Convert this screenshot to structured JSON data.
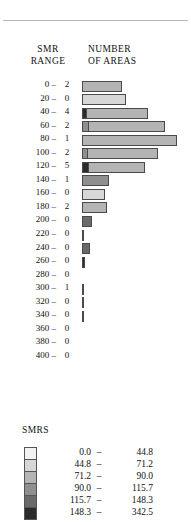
{
  "headers": {
    "smr_range": "SMR\nRANGE",
    "number_of_areas": "NUMBER\nOF AREAS"
  },
  "legend": {
    "title": "SMRS",
    "dash": "–",
    "classes": [
      {
        "lo": "0.0",
        "hi": "44.8",
        "swatch": "#f2f2f2"
      },
      {
        "lo": "44.8",
        "hi": "71.2",
        "swatch": "#d7d7d7"
      },
      {
        "lo": "71.2",
        "hi": "90.0",
        "swatch": "#b4b4b4"
      },
      {
        "lo": "90.0",
        "hi": "115.7",
        "swatch": "#8f8f8f"
      },
      {
        "lo": "115.7",
        "hi": "148.3",
        "swatch": "#6a6a6a"
      },
      {
        "lo": "148.3",
        "hi": "342.5",
        "swatch": "#2b2b2b"
      }
    ]
  },
  "chart_data": {
    "type": "bar",
    "orientation": "horizontal",
    "title": "",
    "xlabel": "NUMBER OF AREAS",
    "ylabel": "SMR RANGE",
    "grid": false,
    "legend_position": "below",
    "categories": [
      "0 –",
      "20 –",
      "40 –",
      "60 –",
      "80 –",
      "100 –",
      "120 –",
      "140 –",
      "160 –",
      "180 –",
      "200 –",
      "220 –",
      "240 –",
      "260 –",
      "280 –",
      "300 –",
      "320 –",
      "340 –",
      "360 –",
      "380 –",
      "400 –"
    ],
    "count_labels": [
      "2",
      "0",
      "4",
      "2",
      "1",
      "2",
      "5",
      "1",
      "0",
      "2",
      "0",
      "0",
      "0",
      "0",
      "0",
      "1",
      "0",
      "0",
      "0",
      "0",
      "0"
    ],
    "values": [
      40,
      44,
      66,
      83,
      95,
      76,
      63,
      27,
      23,
      25,
      10,
      2,
      8,
      3,
      0,
      2,
      1,
      1,
      0,
      0,
      0
    ],
    "bar_px_widths": [
      40,
      44,
      66,
      83,
      95,
      76,
      63,
      27,
      23,
      25,
      10,
      2,
      8,
      3,
      0,
      2,
      1,
      1,
      0,
      0,
      0
    ],
    "segments": [
      [
        {
          "shade": 2,
          "w": 40
        }
      ],
      [
        {
          "shade": 1,
          "w": 44
        }
      ],
      [
        {
          "shade": 5,
          "w": 4
        },
        {
          "shade": 2,
          "w": 62
        }
      ],
      [
        {
          "shade": 3,
          "w": 6
        },
        {
          "shade": 2,
          "w": 77
        }
      ],
      [
        {
          "shade": 2,
          "w": 95
        }
      ],
      [
        {
          "shade": 3,
          "w": 5
        },
        {
          "shade": 2,
          "w": 71
        }
      ],
      [
        {
          "shade": 5,
          "w": 6
        },
        {
          "shade": 2,
          "w": 57
        }
      ],
      [
        {
          "shade": 3,
          "w": 27
        }
      ],
      [
        {
          "shade": 1,
          "w": 23
        }
      ],
      [
        {
          "shade": 2,
          "w": 25
        }
      ],
      [
        {
          "shade": 4,
          "w": 10
        }
      ],
      [
        {
          "shade": 5,
          "w": 2
        }
      ],
      [
        {
          "shade": 4,
          "w": 8
        }
      ],
      [
        {
          "shade": 5,
          "w": 3
        }
      ],
      [],
      [
        {
          "shade": 5,
          "w": 2
        }
      ],
      [
        {
          "shade": 3,
          "w": 1
        }
      ],
      [
        {
          "shade": 3,
          "w": 1
        }
      ],
      [],
      [],
      []
    ],
    "xlim": [
      0,
      100
    ],
    "ylim": [
      0,
      420
    ]
  }
}
